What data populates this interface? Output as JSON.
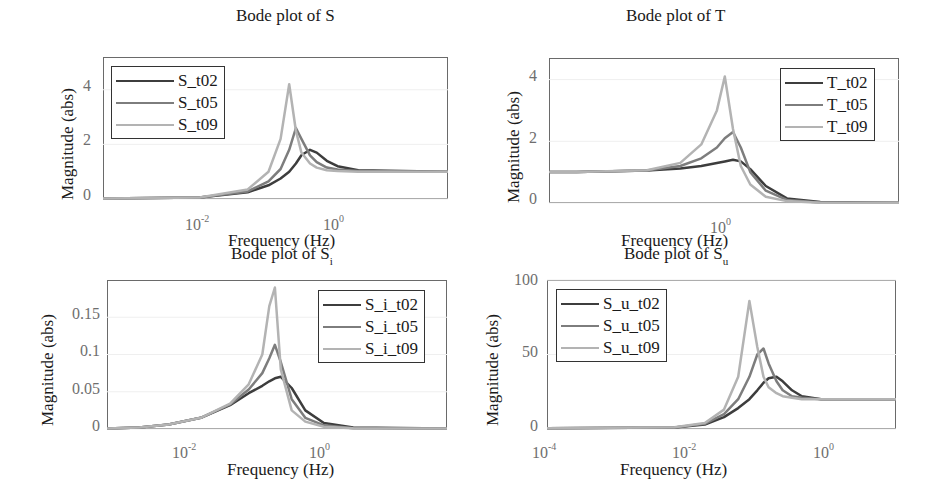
{
  "colors": {
    "t02": "#3d3d3d",
    "t05": "#7d7d7d",
    "t09": "#b3b3b3",
    "axes": "#6a6a6a"
  },
  "chart_data": [
    {
      "type": "line",
      "title": "Bode plot of S",
      "xlabel": "Frequency  (Hz)",
      "ylabel": "Magnitude (abs)",
      "xscale": "log",
      "xlim": [
        0.0004,
        40
      ],
      "ylim": [
        0,
        5.2
      ],
      "xticks": [
        "10^-2",
        "10^0"
      ],
      "yticks": [
        "0",
        "2",
        "4"
      ],
      "legend_position": "upper left",
      "x": [
        0.0004,
        0.01,
        0.05,
        0.1,
        0.15,
        0.2,
        0.25,
        0.3,
        0.4,
        0.5,
        0.7,
        1,
        2,
        40
      ],
      "series": [
        {
          "name": "S_t02",
          "values": [
            0.02,
            0.05,
            0.25,
            0.5,
            0.75,
            1.0,
            1.3,
            1.6,
            1.8,
            1.7,
            1.4,
            1.2,
            1.05,
            1.0
          ]
        },
        {
          "name": "S_t05",
          "values": [
            0.02,
            0.05,
            0.28,
            0.65,
            1.1,
            1.8,
            2.6,
            2.2,
            1.6,
            1.35,
            1.15,
            1.08,
            1.02,
            1.0
          ]
        },
        {
          "name": "S_t09",
          "values": [
            0.02,
            0.06,
            0.35,
            1.0,
            2.2,
            4.2,
            2.5,
            1.7,
            1.3,
            1.15,
            1.05,
            1.02,
            1.0,
            1.0
          ]
        }
      ]
    },
    {
      "type": "line",
      "title": "Bode plot of T",
      "xlabel": "Frequency  (Hz)",
      "ylabel": "Magnitude (abs)",
      "xscale": "log",
      "xlim": [
        0.0004,
        40
      ],
      "ylim": [
        0,
        4.7
      ],
      "xticks": [
        "10^0"
      ],
      "yticks": [
        "0",
        "2",
        "4"
      ],
      "legend_position": "upper right",
      "x": [
        0.0004,
        0.001,
        0.01,
        0.03,
        0.06,
        0.1,
        0.13,
        0.17,
        0.22,
        0.3,
        0.5,
        1,
        3,
        40
      ],
      "series": [
        {
          "name": "T_t02",
          "values": [
            1.0,
            1.0,
            1.05,
            1.12,
            1.2,
            1.3,
            1.35,
            1.4,
            1.35,
            1.1,
            0.55,
            0.15,
            0.03,
            0.01
          ]
        },
        {
          "name": "T_t05",
          "values": [
            1.0,
            1.0,
            1.05,
            1.2,
            1.45,
            1.8,
            2.1,
            2.3,
            1.8,
            1.0,
            0.4,
            0.1,
            0.02,
            0.01
          ]
        },
        {
          "name": "T_t09",
          "values": [
            1.0,
            1.0,
            1.06,
            1.3,
            1.9,
            3.0,
            4.1,
            2.4,
            1.2,
            0.6,
            0.2,
            0.06,
            0.01,
            0.01
          ]
        }
      ]
    },
    {
      "type": "line",
      "title": "Bode plot of S_i",
      "xlabel": "Frequency  (Hz)",
      "ylabel": "Magnitude (abs)",
      "xscale": "log",
      "xlim": [
        0.0003,
        100
      ],
      "ylim": [
        0,
        0.2
      ],
      "xticks": [
        "10^-2",
        "10^0"
      ],
      "yticks": [
        "0",
        "0.05",
        "0.1",
        "0.15"
      ],
      "legend_position": "upper right",
      "x": [
        0.0003,
        0.001,
        0.003,
        0.01,
        0.03,
        0.06,
        0.1,
        0.13,
        0.16,
        0.2,
        0.3,
        0.5,
        1,
        3,
        100
      ],
      "series": [
        {
          "name": "S_i_t02",
          "values": [
            0.0005,
            0.002,
            0.006,
            0.015,
            0.032,
            0.048,
            0.058,
            0.064,
            0.068,
            0.07,
            0.055,
            0.025,
            0.008,
            0.002,
            0.0005
          ]
        },
        {
          "name": "S_i_t05",
          "values": [
            0.0005,
            0.002,
            0.006,
            0.015,
            0.033,
            0.053,
            0.075,
            0.095,
            0.113,
            0.09,
            0.04,
            0.015,
            0.005,
            0.001,
            0.0005
          ]
        },
        {
          "name": "S_i_t09",
          "values": [
            0.0005,
            0.002,
            0.006,
            0.015,
            0.034,
            0.06,
            0.1,
            0.165,
            0.19,
            0.08,
            0.025,
            0.01,
            0.003,
            0.001,
            0.0005
          ]
        }
      ]
    },
    {
      "type": "line",
      "title": "Bode plot of S_u",
      "xlabel": "Frequency  (Hz)",
      "ylabel": "Magnitude (abs)",
      "xscale": "log",
      "xlim": [
        0.0001,
        30
      ],
      "ylim": [
        0,
        100
      ],
      "xticks": [
        "10^-4",
        "10^-2",
        "10^0"
      ],
      "yticks": [
        "0",
        "50",
        "100"
      ],
      "legend_position": "upper left",
      "x": [
        0.0001,
        0.01,
        0.03,
        0.06,
        0.1,
        0.15,
        0.2,
        0.25,
        0.3,
        0.4,
        0.5,
        0.7,
        1,
        2,
        30
      ],
      "series": [
        {
          "name": "S_u_t02",
          "values": [
            0.5,
            1.0,
            3,
            8,
            14,
            20,
            26,
            31,
            34,
            35,
            32,
            26,
            22,
            20,
            20
          ]
        },
        {
          "name": "S_u_t05",
          "values": [
            0.5,
            1.0,
            3.5,
            10,
            20,
            35,
            50,
            54,
            44,
            32,
            26,
            22,
            21,
            20,
            20
          ]
        },
        {
          "name": "S_u_t09",
          "values": [
            0.5,
            1.2,
            4,
            13,
            35,
            86,
            55,
            35,
            28,
            24,
            22,
            21,
            20,
            20,
            20
          ]
        }
      ]
    }
  ],
  "panels": [
    {
      "title_main": "Bode plot of S",
      "title_sub": "",
      "ylabel": "Magnitude (abs)",
      "xlabel": "Frequency  (Hz)",
      "legend": [
        "S_t02",
        "S_t05",
        "S_t09"
      ]
    },
    {
      "title_main": "Bode plot of T",
      "title_sub": "",
      "ylabel": "Magnitude (abs)",
      "xlabel": "Frequency  (Hz)",
      "legend": [
        "T_t02",
        "T_t05",
        "T_t09"
      ]
    },
    {
      "title_main": "Bode plot of S",
      "title_sub": "i",
      "ylabel": "Magnitude (abs)",
      "xlabel": "Frequency  (Hz)",
      "legend": [
        "S_i_t02",
        "S_i_t05",
        "S_i_t09"
      ]
    },
    {
      "title_main": "Bode plot of S",
      "title_sub": "u",
      "ylabel": "Magnitude (abs)",
      "xlabel": "Frequency  (Hz)",
      "legend": [
        "S_u_t02",
        "S_u_t05",
        "S_u_t09"
      ]
    }
  ]
}
